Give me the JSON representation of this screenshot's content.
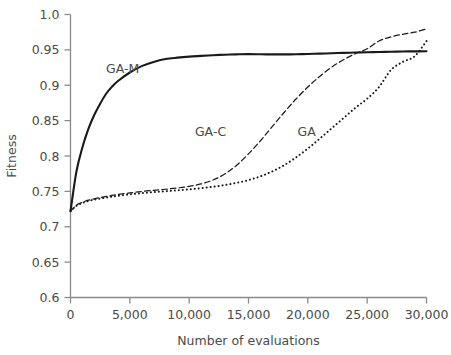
{
  "chart_data": {
    "type": "line",
    "title": "",
    "subtitle": "",
    "xlabel": "Number of evaluations",
    "ylabel": "Fitness",
    "xlim": [
      0,
      30000
    ],
    "ylim": [
      0.6,
      1.0
    ],
    "grid": false,
    "legend_position": "inline-annotations",
    "x_ticks": [
      0,
      5000,
      10000,
      15000,
      20000,
      25000,
      30000
    ],
    "x_tick_labels": [
      "0",
      "5,000",
      "10,000",
      "15,000",
      "20,000",
      "25,000",
      "30,000"
    ],
    "y_ticks": [
      0.6,
      0.65,
      0.7,
      0.75,
      0.8,
      0.85,
      0.9,
      0.95,
      1.0
    ],
    "y_tick_labels": [
      "0.6",
      "0.65",
      "0.7",
      "0.75",
      "0.8",
      "0.85",
      "0.9",
      "0.95",
      "1.0"
    ],
    "x": [
      0,
      500,
      1000,
      1500,
      2000,
      2500,
      3000,
      3500,
      4000,
      5000,
      6000,
      7000,
      8000,
      9000,
      10000,
      11000,
      12000,
      13000,
      14000,
      15000,
      16000,
      17000,
      18000,
      19000,
      20000,
      21000,
      22000,
      23000,
      24000,
      25000,
      26000,
      27000,
      28000,
      29000,
      30000
    ],
    "series": [
      {
        "name": "GA-M",
        "style": "solid",
        "color": "#1a1a1a",
        "line_width": 2.1,
        "label": "GA-M",
        "label_x": 4400,
        "label_y": 0.917,
        "values": [
          0.722,
          0.778,
          0.812,
          0.838,
          0.858,
          0.874,
          0.888,
          0.898,
          0.906,
          0.918,
          0.927,
          0.933,
          0.937,
          0.939,
          0.9405,
          0.9415,
          0.9425,
          0.9432,
          0.9437,
          0.944,
          0.9438,
          0.9436,
          0.9436,
          0.9438,
          0.9442,
          0.9447,
          0.9452,
          0.9458,
          0.9462,
          0.9466,
          0.947,
          0.9474,
          0.9477,
          0.9479,
          0.948
        ]
      },
      {
        "name": "GA-C",
        "style": "dashed",
        "color": "#3a3a3a",
        "line_width": 1.25,
        "label": "GA-C",
        "label_x": 11800,
        "label_y": 0.828,
        "values": [
          0.722,
          0.7305,
          0.7345,
          0.7375,
          0.7395,
          0.7412,
          0.7428,
          0.7442,
          0.7455,
          0.7478,
          0.7498,
          0.7515,
          0.753,
          0.7548,
          0.757,
          0.7605,
          0.766,
          0.7745,
          0.787,
          0.803,
          0.8215,
          0.8415,
          0.8615,
          0.8805,
          0.8975,
          0.9125,
          0.9255,
          0.936,
          0.9445,
          0.9515,
          0.9625,
          0.9685,
          0.972,
          0.975,
          0.9795
        ]
      },
      {
        "name": "GA",
        "style": "dotted",
        "color": "#1a1a1a",
        "line_width": 2.0,
        "label": "GA",
        "label_x": 19900,
        "label_y": 0.828,
        "values": [
          0.722,
          0.7295,
          0.7335,
          0.7362,
          0.7382,
          0.7398,
          0.7412,
          0.7425,
          0.7437,
          0.7458,
          0.7475,
          0.749,
          0.7502,
          0.7515,
          0.7528,
          0.7545,
          0.7565,
          0.759,
          0.762,
          0.766,
          0.7712,
          0.7782,
          0.787,
          0.798,
          0.8105,
          0.8245,
          0.839,
          0.8535,
          0.868,
          0.881,
          0.8975,
          0.9215,
          0.933,
          0.941,
          0.9625
        ]
      }
    ]
  }
}
